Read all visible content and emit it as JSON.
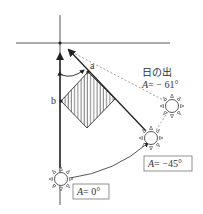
{
  "diagram": {
    "labels": {
      "point_a": "a",
      "point_b": "b",
      "sunrise_title": "日の出",
      "sunrise_azimuth_var": "A",
      "sunrise_azimuth_value": "= − 61°",
      "sun45_var": "A",
      "sun45_value": "= −45°",
      "sun0_var": "A",
      "sun0_value": "= 0°"
    },
    "suns": [
      {
        "name": "sunrise",
        "azimuth": "-61°"
      },
      {
        "name": "sun-45",
        "azimuth": "-45°"
      },
      {
        "name": "sun-0",
        "azimuth": "0°"
      }
    ],
    "colors": {
      "line": "#333333",
      "dashed": "#888888",
      "hatch": "#333333"
    }
  }
}
